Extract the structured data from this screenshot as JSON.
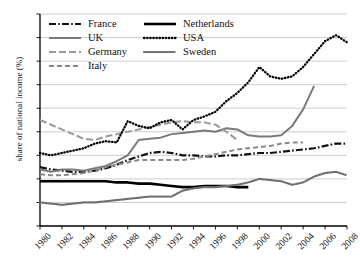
{
  "chart_data": {
    "type": "line",
    "title": "",
    "xlabel": "",
    "ylabel": "share of national income (%)",
    "xlim": [
      1980,
      2008
    ],
    "ylim": [
      2,
      20
    ],
    "ytick_step": 2,
    "xtick_step": 2,
    "grid": "horizontal",
    "legend_position": "top-left",
    "ticks": {
      "y": [
        "20",
        "18",
        "16",
        "14",
        "12",
        "10",
        "8",
        "6",
        "4",
        "2"
      ],
      "x": [
        "1980",
        "1982",
        "1984",
        "1986",
        "1988",
        "1990",
        "1992",
        "1994",
        "1996",
        "1998",
        "2000",
        "2002",
        "2004",
        "2006",
        "2008"
      ]
    },
    "series": [
      {
        "name": "France",
        "style": "dash-dot",
        "color": "#111111",
        "x": [
          1980,
          1981,
          1982,
          1983,
          1984,
          1985,
          1986,
          1987,
          1988,
          1989,
          1990,
          1991,
          1992,
          1993,
          1994,
          1995,
          1996,
          1997,
          1998,
          1999,
          2000,
          2001,
          2002,
          2003,
          2004,
          2005,
          2006,
          2007,
          2008
        ],
        "values": [
          7.0,
          6.8,
          6.7,
          6.6,
          6.6,
          6.7,
          6.9,
          7.2,
          7.6,
          7.9,
          8.2,
          8.3,
          8.2,
          8.0,
          8.0,
          7.9,
          7.9,
          8.0,
          8.0,
          8.1,
          8.2,
          8.2,
          8.3,
          8.4,
          8.5,
          8.6,
          8.8,
          9.0,
          9.0
        ]
      },
      {
        "name": "UK",
        "style": "solid",
        "color": "#7a7a7a",
        "x": [
          1980,
          1981,
          1982,
          1983,
          1984,
          1985,
          1986,
          1987,
          1988,
          1989,
          1990,
          1991,
          1992,
          1993,
          1994,
          1995,
          1996,
          1997,
          1998,
          1999,
          2000,
          2001,
          2002,
          2003,
          2004,
          2005
        ],
        "values": [
          6.8,
          6.6,
          6.8,
          6.8,
          6.7,
          6.9,
          7.1,
          7.5,
          8.0,
          9.3,
          9.4,
          9.5,
          9.8,
          9.9,
          10.0,
          10.1,
          10.0,
          10.3,
          10.2,
          9.7,
          9.6,
          9.6,
          9.7,
          10.5,
          11.9,
          13.9
        ]
      },
      {
        "name": "Germany",
        "style": "long-dash",
        "color": "#9a9a9a",
        "x": [
          1980,
          1981,
          1982,
          1983,
          1984,
          1985,
          1986,
          1987,
          1988,
          1989,
          1990,
          1991,
          1992,
          1993,
          1994,
          1995,
          1996,
          1997,
          1998
        ],
        "values": [
          11.0,
          10.6,
          10.2,
          9.8,
          9.4,
          9.3,
          9.6,
          9.8,
          10.0,
          10.2,
          10.4,
          10.6,
          10.8,
          10.9,
          10.8,
          10.8,
          10.6,
          10.0,
          9.3
        ]
      },
      {
        "name": "Italy",
        "style": "dashed",
        "color": "#8a8a8a",
        "x": [
          1980,
          1981,
          1982,
          1983,
          1984,
          1985,
          1986,
          1987,
          1988,
          1989,
          1990,
          1991,
          1992,
          1993,
          1994,
          1995,
          1996,
          1997,
          1998,
          1999,
          2000,
          2001,
          2002,
          2003,
          2004
        ],
        "values": [
          6.4,
          6.3,
          6.3,
          6.4,
          6.5,
          6.7,
          7.0,
          7.2,
          7.4,
          7.6,
          7.6,
          7.6,
          7.6,
          7.6,
          7.7,
          7.9,
          8.1,
          8.3,
          8.5,
          8.6,
          8.7,
          8.8,
          9.0,
          9.1,
          9.1
        ]
      },
      {
        "name": "Netherlands",
        "style": "solid-thick",
        "color": "#000000",
        "x": [
          1980,
          1981,
          1982,
          1983,
          1984,
          1985,
          1986,
          1987,
          1988,
          1989,
          1990,
          1991,
          1992,
          1993,
          1994,
          1995,
          1996,
          1997,
          1998,
          1999
        ],
        "values": [
          5.8,
          5.8,
          5.8,
          5.8,
          5.8,
          5.8,
          5.8,
          5.7,
          5.7,
          5.6,
          5.6,
          5.5,
          5.4,
          5.3,
          5.3,
          5.4,
          5.4,
          5.4,
          5.3,
          5.3
        ]
      },
      {
        "name": "USA",
        "style": "dotted",
        "color": "#000000",
        "x": [
          1980,
          1981,
          1982,
          1983,
          1984,
          1985,
          1986,
          1987,
          1988,
          1989,
          1990,
          1991,
          1992,
          1993,
          1994,
          1995,
          1996,
          1997,
          1998,
          1999,
          2000,
          2001,
          2002,
          2003,
          2004,
          2005,
          2006,
          2007,
          2008
        ],
        "values": [
          8.2,
          8.0,
          8.2,
          8.4,
          8.6,
          9.0,
          9.2,
          9.1,
          10.9,
          10.5,
          10.3,
          10.8,
          11.0,
          10.2,
          11.0,
          11.3,
          11.7,
          12.6,
          13.3,
          14.2,
          15.5,
          14.7,
          14.5,
          14.7,
          15.5,
          16.6,
          17.7,
          18.2,
          17.6
        ]
      },
      {
        "name": "Sweden",
        "style": "fine-dotted",
        "color": "#6f6f6f",
        "x": [
          1980,
          1981,
          1982,
          1983,
          1984,
          1985,
          1986,
          1987,
          1988,
          1989,
          1990,
          1991,
          1992,
          1993,
          1994,
          1995,
          1996,
          1997,
          1998,
          1999,
          2000,
          2001,
          2002,
          2003,
          2004,
          2005,
          2006,
          2007,
          2008
        ],
        "values": [
          4.0,
          3.9,
          3.8,
          3.9,
          4.0,
          4.0,
          4.1,
          4.2,
          4.3,
          4.4,
          4.5,
          4.5,
          4.5,
          5.0,
          5.2,
          5.3,
          5.3,
          5.4,
          5.5,
          5.7,
          6.0,
          5.9,
          5.8,
          5.5,
          5.7,
          6.2,
          6.5,
          6.6,
          6.3
        ]
      }
    ]
  },
  "legend": {
    "items": [
      {
        "label": "France",
        "key": "France"
      },
      {
        "label": "Netherlands",
        "key": "Netherlands"
      },
      {
        "label": "UK",
        "key": "UK"
      },
      {
        "label": "USA",
        "key": "USA"
      },
      {
        "label": "Germany",
        "key": "Germany"
      },
      {
        "label": "Sweden",
        "key": "Sweden"
      },
      {
        "label": "Italy",
        "key": "Italy"
      }
    ]
  }
}
